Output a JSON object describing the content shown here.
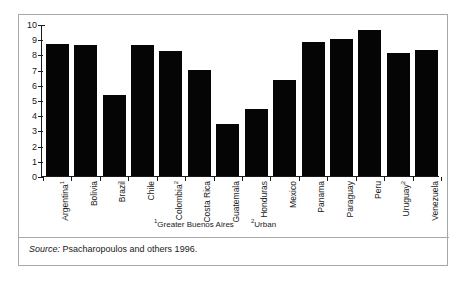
{
  "chart_data": {
    "type": "bar",
    "title": "",
    "subtitle": "",
    "xlabel": "",
    "ylabel": "",
    "ylim": [
      0,
      10
    ],
    "yticks": [
      0,
      1,
      2,
      3,
      4,
      5,
      6,
      7,
      8,
      9,
      10
    ],
    "grid": false,
    "legend": null,
    "bar_color": "#050505",
    "categories": [
      "Argentina",
      "Bolivia",
      "Brazil",
      "Chile",
      "Colombia",
      "Costa Rica",
      "Guatemala",
      "Honduras",
      "Mexico",
      "Panama",
      "Paraguay",
      "Peru",
      "Uruguay",
      "Venezuela"
    ],
    "category_footnote_marks": [
      "1",
      "",
      "",
      "",
      "2",
      "",
      "",
      "",
      "",
      "",
      "",
      "",
      "2",
      ""
    ],
    "values": [
      8.7,
      8.6,
      5.3,
      8.6,
      8.2,
      7.0,
      3.4,
      4.4,
      6.3,
      8.8,
      9.0,
      9.6,
      8.1,
      8.3
    ],
    "annotations": [
      {
        "mark": "1",
        "text": "Greater Buenos Aires"
      },
      {
        "mark": "2",
        "text": "Urban"
      }
    ]
  },
  "footnotes": {
    "one_mark": "1",
    "one_text": "Greater Buenos Aires",
    "two_mark": "2",
    "two_text": "Urban"
  },
  "source": {
    "label": "Source:",
    "text": "Psacharopoulos and others 1996."
  }
}
